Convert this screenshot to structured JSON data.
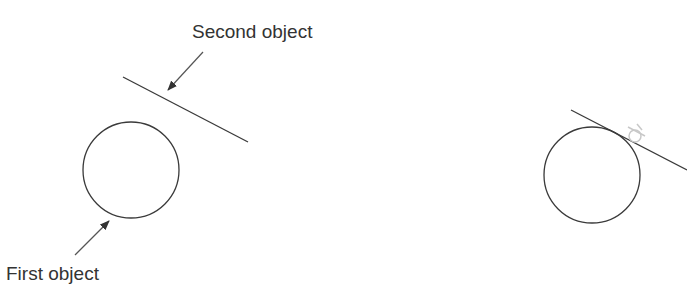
{
  "labels": {
    "second_object": "Second object",
    "first_object": "First object"
  },
  "colors": {
    "stroke": "#3a3a3a",
    "arrow": "#555555",
    "tangent_symbol": "#c8c8c8",
    "background": "#ffffff"
  },
  "panels": [
    {
      "name": "before",
      "circle": {
        "cx": 131,
        "cy": 170,
        "r": 48
      },
      "line": {
        "x1": 123,
        "y1": 77,
        "x2": 248,
        "y2": 142
      },
      "arrows": [
        {
          "target": "line",
          "x1": 203,
          "y1": 52,
          "x2": 168,
          "y2": 90
        },
        {
          "target": "circle",
          "x1": 75,
          "y1": 255,
          "x2": 109,
          "y2": 221
        }
      ]
    },
    {
      "name": "after",
      "circle": {
        "cx": 592,
        "cy": 175,
        "r": 48
      },
      "line": {
        "x1": 571,
        "y1": 110,
        "x2": 687,
        "y2": 170
      },
      "constraint_icon": "tangent-icon"
    }
  ]
}
